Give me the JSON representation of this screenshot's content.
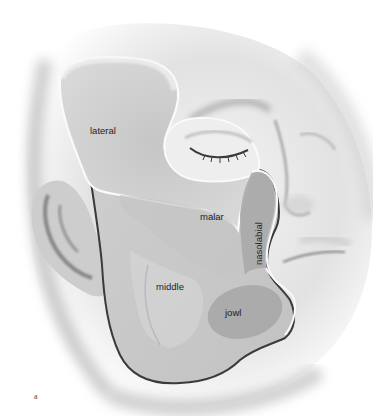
{
  "figure": {
    "panel_label": "a",
    "compartments": [
      {
        "id": "lateral",
        "label": "lateral"
      },
      {
        "id": "malar",
        "label": "malar"
      },
      {
        "id": "nasolabial",
        "label": "nasolabial"
      },
      {
        "id": "middle",
        "label": "middle"
      },
      {
        "id": "jowl",
        "label": "jowl"
      }
    ],
    "colors": {
      "background": "#ffffff",
      "skin_light": "#f2f2f2",
      "skin_mid": "#c9c9c9",
      "skin_shadow": "#8a8a8a",
      "compartment_fill": "#bdbdbd",
      "compartment_dark": "#9e9e9e",
      "outline_dark": "#3a3a3a",
      "outline_light": "#fafafa",
      "label_text": "#1e1e1e"
    }
  }
}
